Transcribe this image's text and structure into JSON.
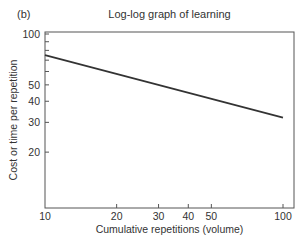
{
  "panel_label": "(b)",
  "chart_data": {
    "type": "line",
    "title": "Log-log graph of learning",
    "xlabel": "Cumulative repetitions (volume)",
    "ylabel": "Cost or time per repetition",
    "xscale": "log",
    "yscale": "log",
    "xlim": [
      10,
      100
    ],
    "ylim": [
      10,
      100
    ],
    "x_ticks": [
      10,
      20,
      30,
      40,
      50,
      100
    ],
    "y_ticks": [
      20,
      30,
      40,
      50,
      100
    ],
    "grid": false,
    "series": [
      {
        "name": "learning curve",
        "x": [
          10,
          100
        ],
        "y": [
          75,
          32
        ]
      }
    ]
  }
}
